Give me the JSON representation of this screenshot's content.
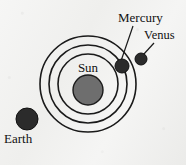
{
  "figure": {
    "background_color": "#f3f3f1",
    "line_color": "#1a1a1a",
    "sun_color": "#6e6e6e",
    "planet_color": "#2b2b2b"
  },
  "labels": {
    "sun": "Sun",
    "mercury": "Mercury",
    "venus": "Venus",
    "earth": "Earth"
  },
  "chart_data": {
    "type": "scatter",
    "xlabel": "",
    "ylabel": "",
    "center": {
      "x": 88,
      "y": 84
    },
    "orbits": [
      {
        "name": "Mercury orbit",
        "radius": 30
      },
      {
        "name": "Venus orbit",
        "radius": 39
      },
      {
        "name": "Earth orbit",
        "radius": 48
      }
    ],
    "bodies": [
      {
        "name": "Sun",
        "x": 88,
        "y": 90,
        "radius": 15,
        "color": "#6e6e6e",
        "orbit": null
      },
      {
        "name": "Mercury",
        "x": 122,
        "y": 66,
        "radius": 7,
        "color": "#2b2b2b",
        "orbit": "Mercury orbit"
      },
      {
        "name": "Venus",
        "x": 141,
        "y": 59,
        "radius": 6,
        "color": "#2b2b2b",
        "orbit": "Venus orbit"
      },
      {
        "name": "Earth",
        "x": 27,
        "y": 119,
        "radius": 11,
        "color": "#2b2b2b",
        "orbit": "Earth orbit"
      }
    ],
    "leaders": [
      {
        "name": "Mercury leader",
        "x1": 133,
        "y1": 26,
        "x2": 121,
        "y2": 61
      },
      {
        "name": "Venus leader",
        "x1": 154,
        "y1": 43,
        "x2": 143,
        "y2": 55
      }
    ],
    "grid": false,
    "legend": "none"
  }
}
